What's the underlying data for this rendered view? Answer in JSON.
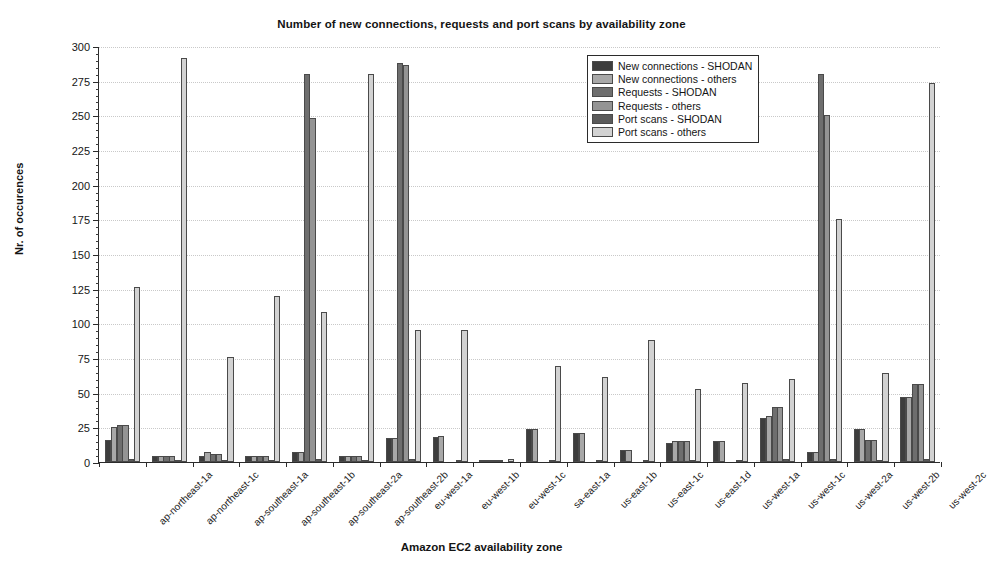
{
  "chart_data": {
    "type": "bar",
    "title": "Number of new connections, requests and port scans by availability zone",
    "xlabel": "Amazon EC2 availability zone",
    "ylabel": "Nr. of occurences",
    "ylim": [
      0,
      300
    ],
    "ytick_step": 25,
    "yticks": [
      0,
      25,
      50,
      75,
      100,
      125,
      150,
      175,
      200,
      225,
      250,
      275,
      300
    ],
    "grid": true,
    "legend_position": "top-right-inside",
    "categories": [
      "ap-northeast-1a",
      "ap-northeast-1c",
      "ap-southeast-1a",
      "ap-southeast-1b",
      "ap-southeast-2a",
      "ap-southeast-2b",
      "eu-west-1a",
      "eu-west-1b",
      "eu-west-1c",
      "sa-east-1a",
      "us-east-1b",
      "us-east-1c",
      "us-east-1d",
      "us-west-1a",
      "us-west-1c",
      "us-west-2a",
      "us-west-2b",
      "us-west-2c"
    ],
    "series": [
      {
        "name": "New connections - SHODAN",
        "color": "#3d3d3d",
        "values": [
          16,
          4,
          4,
          4,
          7,
          4,
          17,
          18,
          1,
          24,
          21,
          9,
          14,
          15,
          32,
          7,
          24,
          47
        ]
      },
      {
        "name": "New connections - others",
        "color": "#a8a8a8",
        "values": [
          25,
          4,
          7,
          4,
          7,
          4,
          17,
          19,
          1,
          24,
          21,
          9,
          15,
          15,
          33,
          7,
          24,
          47
        ]
      },
      {
        "name": "Requests - SHODAN",
        "color": "#6e6e6e",
        "values": [
          27,
          4,
          6,
          4,
          280,
          4,
          288,
          0,
          1,
          0,
          0,
          0,
          15,
          0,
          40,
          280,
          16,
          56
        ]
      },
      {
        "name": "Requests - others",
        "color": "#949494",
        "values": [
          27,
          4,
          6,
          4,
          248,
          4,
          286,
          0,
          1,
          0,
          0,
          0,
          15,
          0,
          40,
          250,
          16,
          56
        ]
      },
      {
        "name": "Port scans - SHODAN",
        "color": "#5a5a5a",
        "values": [
          2,
          1,
          1,
          1,
          2,
          1,
          2,
          1,
          0,
          1,
          1,
          1,
          1,
          1,
          2,
          2,
          1,
          2
        ]
      },
      {
        "name": "Port scans - others",
        "color": "#d2d2d2",
        "values": [
          126,
          291,
          76,
          120,
          108,
          280,
          95,
          95,
          2,
          69,
          61,
          88,
          53,
          57,
          60,
          175,
          64,
          273
        ]
      }
    ]
  },
  "legend": {
    "items": [
      "New connections - SHODAN",
      "New connections - others",
      "Requests - SHODAN",
      "Requests - others",
      "Port scans - SHODAN",
      "Port scans - others"
    ]
  }
}
